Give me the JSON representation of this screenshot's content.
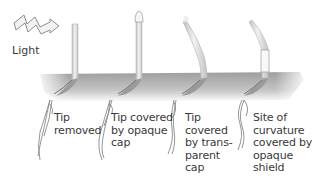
{
  "diagram": {
    "title": "",
    "light": {
      "label": "Light",
      "icon": "zigzag-arrow-icon"
    },
    "colors": {
      "soil": "#a9a9a9",
      "soil_light": "#d4d4d4",
      "coleoptile": "#e2e2e2",
      "coleoptile_edge": "#b0b0b0",
      "root": "#8c8c8c",
      "text": "#3a3a3a"
    },
    "seedlings": [
      {
        "id": 1,
        "state": "upright",
        "label": "Tip\nremoved"
      },
      {
        "id": 2,
        "state": "upright",
        "label": "Tip covered\nby opaque\ncap"
      },
      {
        "id": 3,
        "state": "bent toward light",
        "label": "Tip\ncovered\nby trans-\nparent\ncap"
      },
      {
        "id": 4,
        "state": "bent toward light",
        "label": "Site of\ncurvature\ncovered by\nopaque\nshield"
      }
    ]
  }
}
